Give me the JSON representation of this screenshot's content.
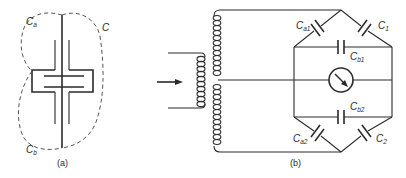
{
  "figure_a": {
    "caption": "(a)",
    "labels": {
      "ca": {
        "main": "C",
        "sub": "a"
      },
      "c": {
        "main": "C",
        "sub": ""
      },
      "cb": {
        "main": "C",
        "sub": "b"
      }
    }
  },
  "figure_b": {
    "caption": "(b)",
    "labels": {
      "ca1": {
        "main": "C",
        "sub": "a1"
      },
      "c1": {
        "main": "C",
        "sub": "1"
      },
      "cb1": {
        "main": "C",
        "sub": "b1"
      },
      "cb2": {
        "main": "C",
        "sub": "b2"
      },
      "ca2": {
        "main": "C",
        "sub": "a2"
      },
      "c2": {
        "main": "C",
        "sub": "2"
      }
    },
    "components": [
      "input-arrow",
      "transformer-primary-coil",
      "transformer-secondary-coil",
      "galvanometer",
      "capacitor-bridge"
    ]
  },
  "colors": {
    "ink": "#2a2a2a",
    "background": "#ffffff"
  }
}
